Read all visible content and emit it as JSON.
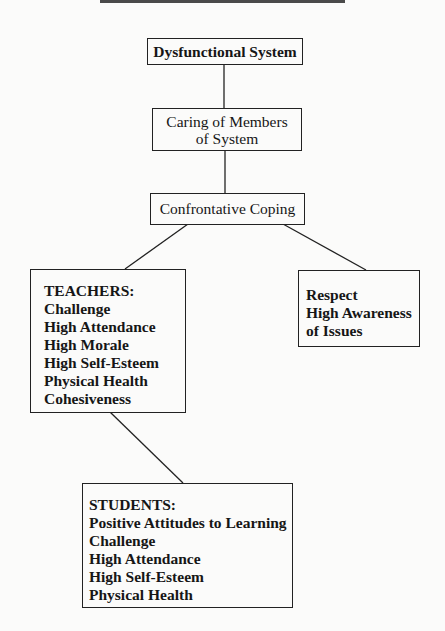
{
  "diagram": {
    "nodes": {
      "dysfunctional": {
        "label": "Dysfunctional System"
      },
      "caring": {
        "lines": [
          "Caring of Members",
          "of System"
        ]
      },
      "coping": {
        "label": "Confrontative Coping"
      },
      "teachers": {
        "heading": "TEACHERS:",
        "items": [
          "Challenge",
          "High Attendance",
          "High Morale",
          "High Self-Esteem",
          "Physical Health",
          "Cohesiveness"
        ]
      },
      "respect": {
        "items": [
          "Respect",
          "High Awareness",
          "of Issues"
        ]
      },
      "students": {
        "heading": "STUDENTS:",
        "items": [
          "Positive Attitudes to Learning",
          "Challenge",
          "High Attendance",
          "High Self-Esteem",
          "Physical Health"
        ]
      }
    },
    "edges": [
      [
        "dysfunctional",
        "caring"
      ],
      [
        "caring",
        "coping"
      ],
      [
        "coping",
        "teachers"
      ],
      [
        "coping",
        "respect"
      ],
      [
        "teachers",
        "students"
      ]
    ]
  }
}
